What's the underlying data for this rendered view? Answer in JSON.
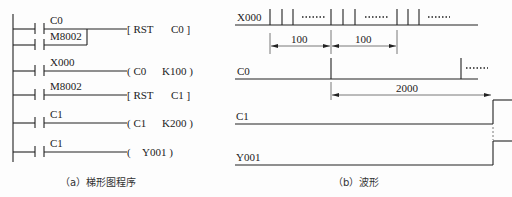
{
  "ladder": {
    "caption": "（a）梯形图程序",
    "rungs": [
      {
        "contacts": [
          "C0",
          "M8002"
        ],
        "parallel": true,
        "instruction": "[ RST",
        "operand": "C0 ]"
      },
      {
        "contacts": [
          "X000"
        ],
        "instruction": "( C0",
        "operand": "K100 )"
      },
      {
        "contacts": [
          "M8002"
        ],
        "instruction": "[ RST",
        "operand": "C1 ]"
      },
      {
        "contacts": [
          "C1"
        ],
        "instruction": "( C1",
        "operand": "K200 )"
      },
      {
        "contacts": [
          "C1"
        ],
        "instruction": "(",
        "operand": "Y001 )"
      }
    ]
  },
  "waveform": {
    "caption": "（b）波形",
    "signals": [
      {
        "name": "X000"
      },
      {
        "name": "C0"
      },
      {
        "name": "C1"
      },
      {
        "name": "Y001"
      }
    ],
    "dimensions": {
      "interval_1": "100",
      "interval_2": "100",
      "interval_total": "2000"
    },
    "ellipsis": "······"
  }
}
